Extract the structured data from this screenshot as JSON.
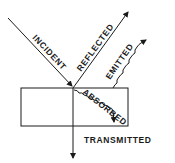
{
  "diagram": {
    "labels": {
      "incident": "INCIDENT",
      "reflected": "REFLECTED",
      "emitted": "EMITTED",
      "absorbed": "ABSORBED",
      "transmitted": "TRANSMITTED"
    },
    "colors": {
      "line": "#1a1a1a",
      "background": "#ffffff"
    }
  }
}
